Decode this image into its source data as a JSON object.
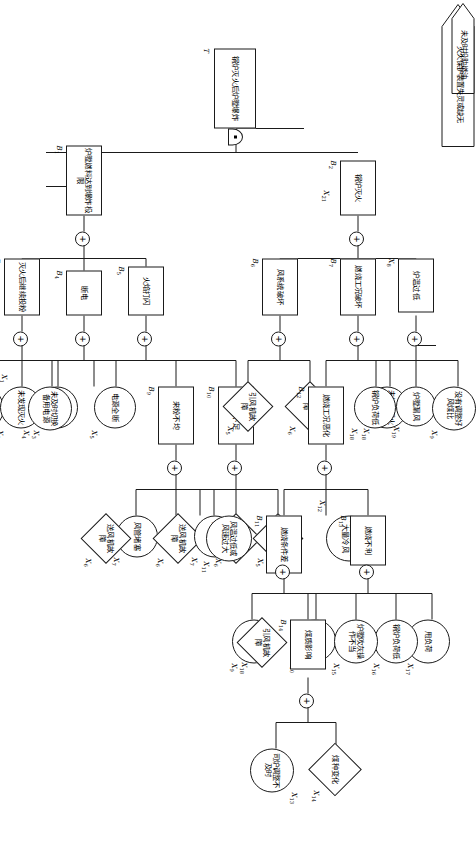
{
  "diagram": {
    "type": "fault-tree",
    "title_symbol": "T",
    "orientation": "rotated-90-on-page",
    "gate_symbols": {
      "or": "+",
      "and": "■"
    }
  },
  "nodes": {
    "T": {
      "id": "T",
      "text": "锅炉灭火后炉膛爆炸",
      "shape": "rect",
      "gate": "and"
    },
    "B1": {
      "id": "B1",
      "text": "炉膛燃料达到爆炸极限",
      "shape": "rect",
      "gate": "or"
    },
    "B2": {
      "id": "B2",
      "text": "锅炉灭火",
      "shape": "rect",
      "gate": "or"
    },
    "B3": {
      "id": "B3",
      "text": "灭火后继续投粉",
      "shape": "rect",
      "gate": "or"
    },
    "B4": {
      "id": "B4",
      "text": "断电",
      "shape": "rect",
      "gate": "or"
    },
    "B5": {
      "id": "B5",
      "text": "火焰打闪",
      "shape": "rect",
      "gate": "or"
    },
    "B6": {
      "id": "B6",
      "text": "风系统破坏",
      "shape": "rect",
      "gate": "or"
    },
    "B7": {
      "id": "B7",
      "text": "燃烧工况破坏",
      "shape": "rect",
      "gate": "or"
    },
    "B9": {
      "id": "B9",
      "text": "来粉不均",
      "shape": "rect",
      "gate": "or"
    },
    "B10": {
      "id": "B10",
      "text": "风量不足",
      "shape": "rect",
      "gate": "or"
    },
    "B11": {
      "id": "B11",
      "text": "燃烧条件差",
      "shape": "rect",
      "gate": "or"
    },
    "B12": {
      "id": "B12",
      "text": "燃烧工况恶化",
      "shape": "rect",
      "gate": "or"
    },
    "B13": {
      "id": "B13",
      "text": "燃烧不利",
      "shape": "rect",
      "gate": "or"
    },
    "B14": {
      "id": "B14",
      "text": "煤质影响",
      "shape": "rect",
      "gate": "or"
    },
    "X1": {
      "id": "X1",
      "text": "炉膛吹扫不彻底",
      "shape": "circle"
    },
    "X2": {
      "id": "X2",
      "text": "未发现灭火",
      "shape": "circle"
    },
    "X3": {
      "id": "X3",
      "text": "采用爆燃法",
      "shape": "circle"
    },
    "X4": {
      "id": "X4",
      "text": "未及时切换备用电源",
      "shape": "circle"
    },
    "X5a": {
      "id": "X5",
      "text": "电源全断",
      "shape": "circle"
    },
    "X5b": {
      "id": "X5",
      "text": "引风机故障",
      "shape": "diamond"
    },
    "X5c": {
      "id": "X5",
      "text": "引风机故障",
      "shape": "diamond"
    },
    "X6a": {
      "id": "X6",
      "text": "送风机故障",
      "shape": "diamond"
    },
    "X6b": {
      "id": "X6",
      "text": "送风机故障",
      "shape": "diamond"
    },
    "X6c": {
      "id": "X6",
      "text": "送风机故障",
      "shape": "diamond"
    },
    "X6d": {
      "id": "X6",
      "text": "送风机故障",
      "shape": "diamond"
    },
    "X7a": {
      "id": "X7",
      "text": "风管堵塞",
      "shape": "circle"
    },
    "X7b": {
      "id": "X7",
      "text": "风管堵塞",
      "shape": "circle"
    },
    "X8": {
      "id": "X8",
      "text": "炉温过低",
      "shape": "rect",
      "gate": "or"
    },
    "X9a": {
      "id": "X9",
      "text": "没有调整好风煤比",
      "shape": "circle"
    },
    "X9b": {
      "id": "X9",
      "text": "未调整好风煤比",
      "shape": "circle"
    },
    "X10": {
      "id": "X10",
      "text": "煤粉太粗",
      "shape": "circle"
    },
    "X11": {
      "id": "X11",
      "text": "风温过低或风速过大",
      "shape": "circle"
    },
    "X12": {
      "id": "X12",
      "text": "除灰时漏入大量冷风",
      "shape": "circle"
    },
    "X13": {
      "id": "X13",
      "text": "司炉调整不及时",
      "shape": "circle"
    },
    "X14": {
      "id": "X14",
      "text": "煤种变化",
      "shape": "diamond"
    },
    "X15": {
      "id": "X15",
      "text": "炉膛吹灰操作不当",
      "shape": "circle"
    },
    "X16": {
      "id": "X16",
      "text": "锅炉负荷低",
      "shape": "circle"
    },
    "X17": {
      "id": "X17",
      "text": "甩负荷",
      "shape": "circle"
    },
    "X18a": {
      "id": "X18",
      "text": "未加强看火调整",
      "shape": "circle"
    },
    "X18b": {
      "id": "X18",
      "text": "引风机故障",
      "shape": "diamond"
    },
    "X18c": {
      "id": "X18",
      "text": "锅炉负荷低",
      "shape": "circle"
    },
    "X19": {
      "id": "X19",
      "text": "炉膛漏风",
      "shape": "circle"
    },
    "X20": {
      "id": "X20",
      "text": "未及时投助燃油",
      "shape": "lens"
    },
    "X21": {
      "id": "X21",
      "text": "灭火保护装置失灵或缺无",
      "shape": "lens"
    }
  },
  "labels": {
    "T": "T",
    "B1": "B",
    "B2": "B",
    "B3": "B",
    "B4": "B",
    "B5": "B",
    "B6": "B",
    "B7": "B",
    "B9": "B",
    "B10": "B",
    "B11": "B",
    "B12": "B",
    "B13": "B",
    "B14": "B",
    "X": "X"
  }
}
